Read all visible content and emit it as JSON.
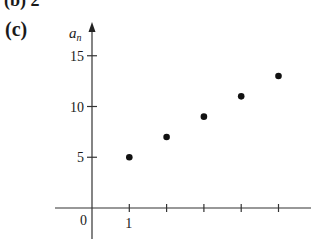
{
  "header": {
    "previous_part_label": "(b)  2",
    "part_label": "(c)"
  },
  "chart_data": {
    "type": "scatter",
    "title": "",
    "xlabel": "n",
    "ylabel": "a_n",
    "ylabel_display": "a",
    "ylabel_sub": "n",
    "x": [
      1,
      2,
      3,
      4,
      5
    ],
    "y": [
      5,
      7,
      9,
      11,
      13
    ],
    "xlim": [
      -0.3,
      5.8
    ],
    "ylim": [
      -1.3,
      17
    ],
    "x_ticks": [
      1,
      2,
      3,
      4,
      5
    ],
    "x_tick_labels": [
      "1",
      "",
      "",
      "",
      ""
    ],
    "y_ticks": [
      5,
      10,
      15
    ],
    "y_tick_labels": [
      "5",
      "10",
      "15"
    ],
    "origin_label": "0",
    "grid": false,
    "legend": null
  }
}
